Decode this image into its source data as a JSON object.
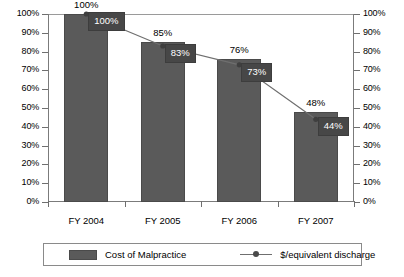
{
  "chart_data": {
    "type": "bar",
    "title": "",
    "xlabel": "",
    "ylabel": "",
    "ylim": [
      0,
      100
    ],
    "y2lim": [
      0,
      100
    ],
    "grid": false,
    "legend_position": "bottom",
    "categories": [
      "FY 2004",
      "FY 2005",
      "FY 2006",
      "FY 2007"
    ],
    "ticks": [
      "0%",
      "10%",
      "20%",
      "30%",
      "40%",
      "50%",
      "60%",
      "70%",
      "80%",
      "90%",
      "100%"
    ],
    "ticks_right": [
      "0%",
      "10%",
      "20%",
      "30%",
      "40%",
      "50%",
      "60%",
      "70%",
      "80%",
      "90%",
      "100%"
    ],
    "series": [
      {
        "name": "Cost of Malpractice",
        "type": "bar",
        "color": "#5a5a5a",
        "values": [
          100,
          85,
          76,
          48
        ],
        "labels": [
          "100%",
          "85%",
          "76%",
          "48%"
        ]
      },
      {
        "name": "$/equivalent discharge",
        "type": "line",
        "color": "#6f6f6f",
        "values": [
          100,
          83,
          73,
          44
        ],
        "labels": [
          "100%",
          "83%",
          "73%",
          "44%"
        ]
      }
    ]
  },
  "legend": {
    "bar_label": "Cost of Malpractice",
    "line_label": "$/equivalent discharge"
  }
}
